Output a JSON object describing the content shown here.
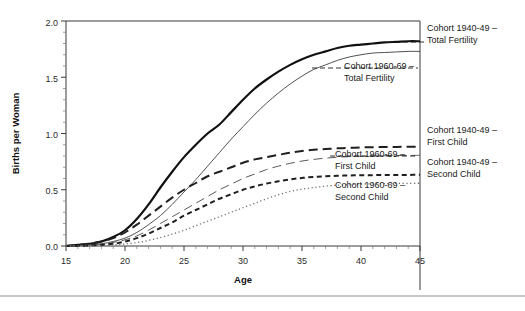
{
  "figure": {
    "background_color": "#ffffff",
    "divider_color": "#b3b3b3"
  },
  "axes": {
    "x_title": "Age",
    "y_title": "Births per Woman",
    "x_ticklabels": [
      "15",
      "20",
      "25",
      "30",
      "35",
      "40",
      "45"
    ],
    "y_ticklabels": [
      "0.0",
      "0.5",
      "1.0",
      "1.5",
      "2.0"
    ]
  },
  "labels": {
    "s1_line1": "Cohort 1940-49 –",
    "s1_line2": "Total Fertility",
    "s2_line1": "Cohort 1960-69 –",
    "s2_line2": "Total Fertility",
    "s3_line1": "Cohort 1940-49 –",
    "s3_line2": "First Child",
    "s4_line1": "Cohort 1960-69 –",
    "s4_line2": "First Child",
    "s5_line1": "Cohort 1940-49 –",
    "s5_line2": "Second Child",
    "s6_line1": "Cohort 1960-69 –",
    "s6_line2": "Second Child"
  },
  "chart_data": {
    "type": "line",
    "title": "",
    "subtitle": "",
    "xlabel": "Age",
    "ylabel": "Births per Woman",
    "xlim": [
      15,
      45
    ],
    "ylim": [
      0.0,
      2.0
    ],
    "x_major_ticks": [
      15,
      20,
      25,
      30,
      35,
      40,
      45
    ],
    "x_minor_tick_step": 1,
    "y_major_ticks": [
      0.0,
      0.5,
      1.0,
      1.5,
      2.0
    ],
    "y_minor_tick_step": 0.1,
    "grid": false,
    "legend_position": "right-inline-labels",
    "x": [
      15,
      16,
      17,
      18,
      19,
      20,
      21,
      22,
      23,
      24,
      25,
      26,
      27,
      28,
      29,
      30,
      31,
      32,
      33,
      34,
      35,
      36,
      37,
      38,
      39,
      40,
      41,
      42,
      43,
      44,
      45
    ],
    "series": [
      {
        "name": "Cohort 1940-49 – Total Fertility",
        "style": "solid-thick",
        "color": "#111111",
        "width": 2.2,
        "values": [
          0.0,
          0.01,
          0.02,
          0.04,
          0.08,
          0.14,
          0.24,
          0.37,
          0.52,
          0.66,
          0.79,
          0.9,
          1.0,
          1.08,
          1.19,
          1.3,
          1.4,
          1.48,
          1.55,
          1.61,
          1.66,
          1.7,
          1.73,
          1.76,
          1.78,
          1.79,
          1.8,
          1.81,
          1.815,
          1.82,
          1.82
        ]
      },
      {
        "name": "Cohort 1960-69 – Total Fertility",
        "style": "solid-thin",
        "color": "#3d3d3d",
        "width": 0.9,
        "values": [
          0.0,
          0.005,
          0.01,
          0.02,
          0.04,
          0.07,
          0.12,
          0.19,
          0.27,
          0.37,
          0.48,
          0.59,
          0.71,
          0.83,
          0.95,
          1.06,
          1.17,
          1.27,
          1.36,
          1.44,
          1.51,
          1.57,
          1.61,
          1.65,
          1.68,
          1.7,
          1.715,
          1.72,
          1.725,
          1.73,
          1.73
        ]
      },
      {
        "name": "Cohort 1940-49 – First Child",
        "style": "dash-long-thick",
        "color": "#1f1f1f",
        "width": 2.0,
        "values": [
          0.0,
          0.01,
          0.02,
          0.04,
          0.07,
          0.12,
          0.19,
          0.27,
          0.35,
          0.43,
          0.5,
          0.56,
          0.62,
          0.66,
          0.7,
          0.74,
          0.77,
          0.79,
          0.81,
          0.83,
          0.845,
          0.855,
          0.862,
          0.868,
          0.872,
          0.876,
          0.878,
          0.88,
          0.881,
          0.882,
          0.883
        ]
      },
      {
        "name": "Cohort 1960-69 – First Child",
        "style": "dash-long-thin",
        "color": "#5a5a5a",
        "width": 1.0,
        "values": [
          0.0,
          0.004,
          0.009,
          0.018,
          0.032,
          0.055,
          0.09,
          0.14,
          0.2,
          0.26,
          0.32,
          0.38,
          0.44,
          0.5,
          0.55,
          0.6,
          0.64,
          0.68,
          0.71,
          0.735,
          0.755,
          0.77,
          0.781,
          0.789,
          0.794,
          0.798,
          0.801,
          0.803,
          0.804,
          0.805,
          0.806
        ]
      },
      {
        "name": "Cohort 1940-49 – Second Child",
        "style": "dash-short-thick",
        "color": "#1f1f1f",
        "width": 2.0,
        "values": [
          0.0,
          0.0,
          0.005,
          0.01,
          0.02,
          0.04,
          0.07,
          0.11,
          0.16,
          0.21,
          0.27,
          0.32,
          0.37,
          0.42,
          0.46,
          0.5,
          0.53,
          0.555,
          0.575,
          0.592,
          0.605,
          0.614,
          0.62,
          0.624,
          0.627,
          0.629,
          0.63,
          0.631,
          0.632,
          0.632,
          0.633
        ]
      },
      {
        "name": "Cohort 1960-69 – Second Child",
        "style": "dotted",
        "color": "#6e6e6e",
        "width": 1.3,
        "values": [
          0.0,
          0.0,
          0.002,
          0.005,
          0.01,
          0.018,
          0.03,
          0.05,
          0.075,
          0.105,
          0.14,
          0.18,
          0.22,
          0.26,
          0.3,
          0.34,
          0.38,
          0.42,
          0.455,
          0.485,
          0.505,
          0.52,
          0.532,
          0.54,
          0.546,
          0.55,
          0.553,
          0.555,
          0.556,
          0.557,
          0.558
        ]
      }
    ]
  }
}
